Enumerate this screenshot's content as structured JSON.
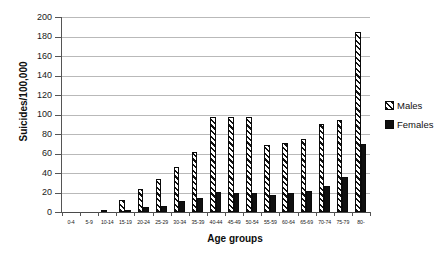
{
  "chart_data": {
    "type": "bar",
    "title": "",
    "xlabel": "Age groups",
    "ylabel": "Suicides/100,000",
    "ylim": [
      0,
      200
    ],
    "ytick_step": 20,
    "yticks": [
      0,
      20,
      40,
      60,
      80,
      100,
      120,
      140,
      160,
      180,
      200
    ],
    "grid": true,
    "legend_position": "right",
    "categories": [
      "0-4",
      "5-9",
      "10-14",
      "15-19",
      "20-24",
      "25-29",
      "30-34",
      "35-39",
      "40-44",
      "45-49",
      "50-54",
      "55-59",
      "60-64",
      "65-69",
      "70-74",
      "75-79",
      "80-"
    ],
    "series": [
      {
        "name": "Males",
        "values": [
          0,
          0,
          1.5,
          12.5,
          23.5,
          33.5,
          46.5,
          61.5,
          97.5,
          97.5,
          97.5,
          68.5,
          70.5,
          74.5,
          90.5,
          94.5,
          185.0
        ]
      },
      {
        "name": "Females",
        "values": [
          0,
          0,
          0.0,
          2.5,
          5.0,
          6.0,
          11.5,
          14.0,
          21.0,
          19.5,
          20.0,
          17.5,
          19.5,
          21.5,
          26.5,
          35.5,
          70.0
        ]
      }
    ]
  },
  "legend": {
    "items": [
      {
        "label": "Males",
        "swatch": "hatched-swatch"
      },
      {
        "label": "Females",
        "swatch": "solid-black-swatch"
      }
    ]
  }
}
